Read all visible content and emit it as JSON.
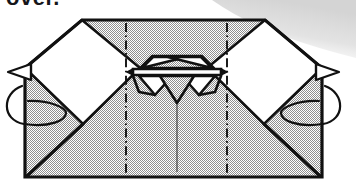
{
  "page": {
    "kind": "origami-instruction-diagram",
    "caption_fragment": "over.",
    "background_color": "#ffffff"
  },
  "palette": {
    "paper_front": "#a8a8a8",
    "paper_back": "#ffffff",
    "ink": "#111111",
    "scan_shadow": "#d9d9d9",
    "crease_line": "#111111"
  },
  "figure": {
    "label": "Folded paper model, wide trapezoidal body with two white wing flaps and a central pleated beak detail",
    "bounds": {
      "x": 25,
      "y": 20,
      "width": 297,
      "height": 157
    },
    "body_fill": "paper_front",
    "outline_width": 3
  },
  "annotations": {
    "rotation_arrows": [
      {
        "name": "turn-over-arrow-left",
        "side": "left",
        "meaning": "turn model over (rotate about vertical axis)",
        "arrowhead": "open-triangle"
      },
      {
        "name": "turn-over-arrow-right",
        "side": "right",
        "meaning": "turn model over (rotate about vertical axis)",
        "arrowhead": "open-triangle"
      }
    ],
    "crease_lines": [
      {
        "name": "dash-dot-crease-left",
        "x": 126,
        "style": "dash-dot",
        "meaning": "mountain fold reference"
      },
      {
        "name": "dash-dot-crease-right",
        "x": 227,
        "style": "dash-dot",
        "meaning": "mountain fold reference"
      },
      {
        "name": "center-line",
        "x": 177,
        "style": "thin-solid",
        "meaning": "vertical center axis"
      }
    ],
    "center_detail": {
      "name": "central-pleat-detail",
      "description": "symmetric pair of white triangular pleats flanking a downward point"
    }
  }
}
